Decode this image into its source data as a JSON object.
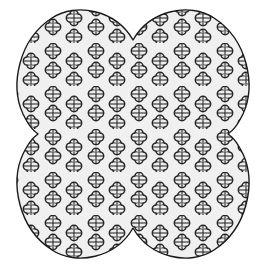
{
  "canvas": {
    "width": 266,
    "height": 268,
    "background_color": "#ffffff",
    "title": "Quatrefoil Patterned Shape"
  },
  "shape": {
    "name": "four-lobed-quatrefoil-silhouette",
    "description": "Butterfly / four-petal clover outline with four rounded lobes and four concave V-notches at the midpoints of each side",
    "fill_color": "#f0f0f0",
    "stroke_color": "#1a1a1a",
    "stroke_width": 1.4,
    "center_x": 133,
    "center_y": 134,
    "lobe_count": 4,
    "notches": [
      {
        "side": "top",
        "apex_x": 133,
        "apex_y": 40
      },
      {
        "side": "right",
        "apex_x": 228,
        "apex_y": 134
      },
      {
        "side": "bottom",
        "apex_x": 133,
        "apex_y": 228
      },
      {
        "side": "left",
        "apex_x": 38,
        "apex_y": 134
      }
    ],
    "path": "M 133 40 C 150 10 190 2 214 18 C 248 40 256 86 243 114 C 236 128 232 131 228 134 C 232 137 236 140 243 154 C 256 182 248 228 214 250 C 190 266 150 258 133 228 C 116 258 76 266 52 250 C 18 228 10 182 23 154 C 30 140 34 137 38 134 C 34 131 30 128 23 114 C 10 86 18 40 52 18 C 76 2 116 10 133 40 Z"
  },
  "pattern": {
    "name": "quatrefoil-floral-motif",
    "motif_type": "quatrefoil",
    "motif_description": "Four overlapping rounded lobes arranged in a cross around a small square center, outlined in dark gray with light fill and a cross of internal lines",
    "motif_outline_color": "#262626",
    "motif_fill_color": "#ededed",
    "motif_stroke_width": 1.5,
    "motif_radius": 4.1,
    "motif_offset": 3.6,
    "tile_width": 43,
    "tile_height": 43,
    "motif_count_visible": 58,
    "arrangement": "Vertical pairs of motifs alternating with single offset motifs in a staggered repeating grid",
    "tile_positions": [
      {
        "x": 10,
        "y": 8
      },
      {
        "x": 10,
        "y": 27
      },
      {
        "x": 31,
        "y": 18
      },
      {
        "x": 31,
        "y": 37
      }
    ]
  },
  "labels": {
    "alt_text": "Decorative four-lobed shape filled with a repeating quatrefoil clover pattern"
  }
}
